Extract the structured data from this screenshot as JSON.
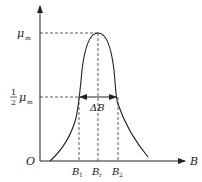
{
  "diagram": {
    "title": "",
    "type": "resonance-curve",
    "x_axis": {
      "label": "B",
      "origin_label": "O"
    },
    "y_axis": {
      "label": ""
    },
    "y_markers": [
      {
        "id": "peak",
        "symbol": "μ",
        "subscript": "m",
        "prefix": ""
      },
      {
        "id": "half",
        "symbol": "μ",
        "subscript": "m",
        "prefix_num": "1",
        "prefix_den": "2"
      }
    ],
    "x_markers": [
      {
        "id": "b1",
        "symbol": "B",
        "subscript": "1"
      },
      {
        "id": "br",
        "symbol": "B",
        "subscript": "r"
      },
      {
        "id": "b2",
        "symbol": "B",
        "subscript": "2"
      }
    ],
    "width_annotation": {
      "label": "ΔB"
    },
    "colors": {
      "stroke": "#222222",
      "background": "#ffffff"
    }
  }
}
